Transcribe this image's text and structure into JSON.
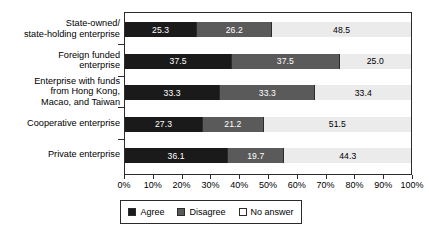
{
  "chart_data": {
    "type": "bar",
    "orientation": "horizontal",
    "stacked": true,
    "normalized_percent": true,
    "title": "",
    "xlabel": "",
    "ylabel": "",
    "xlim": [
      0,
      100
    ],
    "grid": false,
    "legend_position": "bottom",
    "categories": [
      "State-owned/\nstate-holding enterprise",
      "Foreign funded\nenterprise",
      "Enterprise with funds\nfrom Hong Kong,\nMacao, and Taiwan",
      "Cooperative enterprise",
      "Private enterprise"
    ],
    "series": [
      {
        "name": "Agree",
        "color": "#1a1a1a",
        "values": [
          25.3,
          37.5,
          33.3,
          27.3,
          36.1
        ]
      },
      {
        "name": "Disagree",
        "color": "#5a5a5a",
        "values": [
          26.2,
          37.5,
          33.3,
          21.2,
          19.7
        ]
      },
      {
        "name": "No answer",
        "color": "#ebebeb",
        "values": [
          48.5,
          25.0,
          33.4,
          51.5,
          44.3
        ]
      }
    ],
    "tick_labels": [
      "0%",
      "10%",
      "20%",
      "30%",
      "40%",
      "50%",
      "60%",
      "70%",
      "80%",
      "90%",
      "100%"
    ],
    "tick_values": [
      0,
      10,
      20,
      30,
      40,
      50,
      60,
      70,
      80,
      90,
      100
    ],
    "data_labels": [
      [
        "25.3",
        "26.2",
        "48.5"
      ],
      [
        "37.5",
        "37.5",
        "25.0"
      ],
      [
        "33.3",
        "33.3",
        "33.4"
      ],
      [
        "27.3",
        "21.2",
        "51.5"
      ],
      [
        "36.1",
        "19.7",
        "44.3"
      ]
    ]
  },
  "legend": {
    "items": [
      {
        "label": "Agree"
      },
      {
        "label": "Disagree"
      },
      {
        "label": "No answer"
      }
    ]
  }
}
